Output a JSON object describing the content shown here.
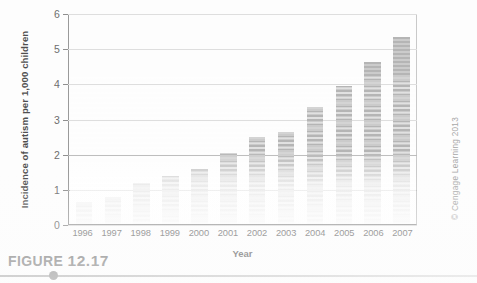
{
  "figure": {
    "caption_prefix": "FIGURE",
    "caption_number": "12.17",
    "credit": "© Cengage Learning 2013"
  },
  "chart_data": {
    "type": "bar",
    "title": "",
    "xlabel": "Year",
    "ylabel": "Incidence of autism per 1,000 children",
    "categories": [
      "1996",
      "1997",
      "1998",
      "1999",
      "2000",
      "2001",
      "2002",
      "2003",
      "2004",
      "2005",
      "2006",
      "2007"
    ],
    "values": [
      0.6,
      0.75,
      1.15,
      1.35,
      1.55,
      2.0,
      2.45,
      2.6,
      3.3,
      3.9,
      4.6,
      5.3
    ],
    "ylim": [
      0,
      6
    ],
    "yticks": [
      "0",
      "1",
      "2",
      "3",
      "4",
      "5",
      "6"
    ],
    "grid": true,
    "legend": "none",
    "bar_color": "#b5b5b5",
    "axis_color": "#9a9a9a",
    "grid_color": "#b9b9b9"
  }
}
